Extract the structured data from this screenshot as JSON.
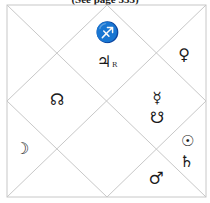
{
  "caption": "(See page 333)",
  "chart": {
    "style": "north-indian-diamond",
    "line_color": "#c8c8c8",
    "glyph_color": "#1a1a1a"
  },
  "houses": [
    {
      "id": "house-1-top-center",
      "items": [
        {
          "symbol": "♐",
          "name": "sagittarius-sign"
        },
        {
          "symbol": "♃",
          "name": "jupiter",
          "suffix": "R"
        }
      ]
    },
    {
      "id": "house-top-right",
      "items": [
        {
          "symbol": "♀",
          "name": "venus"
        }
      ]
    },
    {
      "id": "house-left-upper",
      "items": [
        {
          "symbol": "☊",
          "name": "rahu-north-node"
        }
      ]
    },
    {
      "id": "house-right-center",
      "items": [
        {
          "symbol": "☿",
          "name": "mercury"
        },
        {
          "symbol": "☋",
          "name": "ketu-south-node"
        }
      ]
    },
    {
      "id": "house-left-lower",
      "items": [
        {
          "symbol": "☽",
          "name": "moon"
        }
      ]
    },
    {
      "id": "house-right-lower",
      "items": [
        {
          "symbol": "☉",
          "name": "sun"
        },
        {
          "symbol": "♄",
          "name": "saturn"
        }
      ]
    },
    {
      "id": "house-bottom-right",
      "items": [
        {
          "symbol": "♂",
          "name": "mars"
        }
      ]
    }
  ]
}
